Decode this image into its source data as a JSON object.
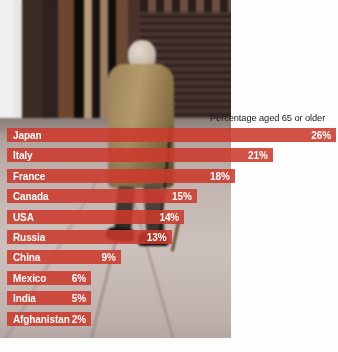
{
  "chart_data": {
    "type": "bar",
    "title": "Percentage aged 65 or older",
    "orientation": "horizontal",
    "xlabel": "",
    "ylabel": "",
    "xlim": [
      0,
      26
    ],
    "grid": false,
    "legend": false,
    "value_suffix": "%",
    "bar_color": "#cc3a2c",
    "label_color": "#ffffff",
    "categories": [
      "Japan",
      "Italy",
      "France",
      "Canada",
      "USA",
      "Russia",
      "China",
      "Mexico",
      "India",
      "Afghanistan"
    ],
    "values": [
      26,
      21,
      18,
      15,
      14,
      13,
      9,
      6,
      5,
      2
    ],
    "value_labels": [
      "26%",
      "21%",
      "18%",
      "15%",
      "14%",
      "13%",
      "9%",
      "6%",
      "5%",
      "2%"
    ],
    "bars": [
      {
        "label": "Japan",
        "value": 26,
        "value_label": "26%"
      },
      {
        "label": "Italy",
        "value": 21,
        "value_label": "21%"
      },
      {
        "label": "France",
        "value": 18,
        "value_label": "18%"
      },
      {
        "label": "Canada",
        "value": 15,
        "value_label": "15%"
      },
      {
        "label": "USA",
        "value": 14,
        "value_label": "14%"
      },
      {
        "label": "Russia",
        "value": 13,
        "value_label": "13%"
      },
      {
        "label": "China",
        "value": 9,
        "value_label": "9%"
      },
      {
        "label": "Mexico",
        "value": 6,
        "value_label": "6%"
      },
      {
        "label": "India",
        "value": 5,
        "value_label": "5%"
      },
      {
        "label": "Afghanistan",
        "value": 2,
        "value_label": "2%"
      }
    ]
  },
  "source": {
    "text": ""
  }
}
